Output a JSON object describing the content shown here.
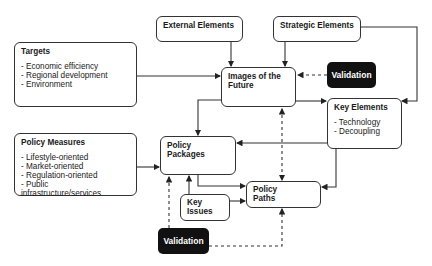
{
  "diagram": {
    "nodes": {
      "external_elements": {
        "title": "External Elements"
      },
      "strategic_elements": {
        "title": "Strategic Elements"
      },
      "targets": {
        "title": "Targets",
        "items": [
          "- Economic efficiency",
          "- Regional development",
          "- Environment"
        ]
      },
      "images_of_future": {
        "title": "Images of the Future"
      },
      "validation_top": {
        "title": "Validation"
      },
      "key_elements": {
        "title": "Key Elements",
        "items": [
          "- Technology",
          "- Decoupling"
        ]
      },
      "policy_measures": {
        "title": "Policy Measures",
        "items": [
          "- Lifestyle-oriented",
          "- Market-oriented",
          "- Regulation-oriented",
          "- Public infrastructure/services"
        ]
      },
      "policy_packages": {
        "title": "Policy Packages"
      },
      "policy_paths": {
        "title": "Policy Paths"
      },
      "key_issues": {
        "title": "Key Issues"
      },
      "validation_bottom": {
        "title": "Validation"
      }
    },
    "edges": [
      {
        "from": "external_elements",
        "to": "images_of_future",
        "style": "solid"
      },
      {
        "from": "strategic_elements",
        "to": "images_of_future",
        "style": "solid"
      },
      {
        "from": "strategic_elements",
        "to": "key_elements",
        "style": "solid"
      },
      {
        "from": "targets",
        "to": "images_of_future",
        "style": "solid"
      },
      {
        "from": "validation_top",
        "to": "images_of_future",
        "style": "dashed"
      },
      {
        "from": "images_of_future",
        "to": "key_elements",
        "style": "solid"
      },
      {
        "from": "images_of_future",
        "to": "policy_packages",
        "style": "solid"
      },
      {
        "from": "images_of_future",
        "to": "policy_paths",
        "style": "dashed-bidirectional"
      },
      {
        "from": "key_elements",
        "to": "policy_packages",
        "style": "solid"
      },
      {
        "from": "key_elements",
        "to": "policy_paths",
        "style": "solid"
      },
      {
        "from": "policy_measures",
        "to": "policy_packages",
        "style": "solid"
      },
      {
        "from": "policy_packages",
        "to": "policy_paths",
        "style": "solid"
      },
      {
        "from": "key_issues",
        "to": "policy_packages",
        "style": "solid"
      },
      {
        "from": "key_issues",
        "to": "policy_paths",
        "style": "solid"
      },
      {
        "from": "validation_bottom",
        "to": "policy_packages",
        "style": "dashed"
      },
      {
        "from": "validation_bottom",
        "to": "policy_paths",
        "style": "dashed"
      }
    ]
  }
}
